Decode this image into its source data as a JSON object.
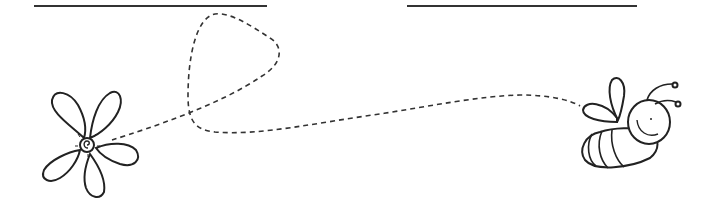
{
  "worksheet": {
    "type": "tracing worksheet",
    "name_line_left": {
      "label": "",
      "x1": 34,
      "x2": 267,
      "y": 6
    },
    "name_line_right": {
      "label": "",
      "x1": 407,
      "x2": 637,
      "y": 6
    },
    "start_image": "flower-icon",
    "end_image": "bee-icon",
    "trace_path": "dashed-loop-path",
    "colors": {
      "ink": "#333333",
      "background": "#ffffff"
    }
  }
}
